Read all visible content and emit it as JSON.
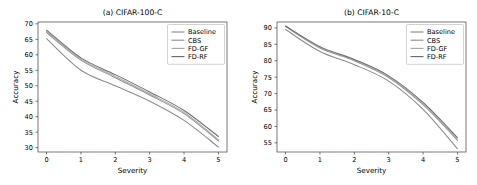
{
  "figure": {
    "background": "#ffffff",
    "panels": [
      "a",
      "b"
    ]
  },
  "chart_data": [
    {
      "type": "line",
      "title": "(a) CIFAR-100-C",
      "xlabel": "Severity",
      "ylabel": "Accuracy",
      "x": [
        0,
        1,
        2,
        3,
        4,
        5
      ],
      "xlim": [
        -0.25,
        5.25
      ],
      "ylim": [
        28.6,
        70.6
      ],
      "xticks": [
        0,
        1,
        2,
        3,
        4,
        5
      ],
      "xticklabels": [
        "0",
        "1",
        "2",
        "3",
        "4",
        "5"
      ],
      "yticks": [
        30,
        35,
        40,
        45,
        50,
        55,
        60,
        65,
        70
      ],
      "yticklabels": [
        "30",
        "35",
        "40",
        "45",
        "50",
        "55",
        "60",
        "65",
        "70"
      ],
      "grid": false,
      "legend_position": "upper right",
      "series": [
        {
          "name": "Baseline",
          "color": "#8c8c8c",
          "values": [
            65.2,
            55.0,
            50.0,
            45.0,
            38.8,
            30.2
          ]
        },
        {
          "name": "CBS",
          "color": "#909090",
          "values": [
            67.2,
            58.3,
            52.6,
            47.0,
            41.0,
            32.2
          ]
        },
        {
          "name": "FD-GF",
          "color": "#a8a8a8",
          "values": [
            67.6,
            58.6,
            53.0,
            47.4,
            41.4,
            32.6
          ]
        },
        {
          "name": "FD-RF",
          "color": "#6e6e6e",
          "values": [
            68.0,
            59.0,
            53.6,
            48.0,
            42.0,
            33.6
          ]
        }
      ]
    },
    {
      "type": "line",
      "title": "(b) CIFAR-10-C",
      "xlabel": "Severity",
      "ylabel": "Accuracy",
      "x": [
        0,
        1,
        2,
        3,
        4,
        5
      ],
      "xlim": [
        -0.25,
        5.25
      ],
      "ylim": [
        52.2,
        91.8
      ],
      "xticks": [
        0,
        1,
        2,
        3,
        4,
        5
      ],
      "xticklabels": [
        "0",
        "1",
        "2",
        "3",
        "4",
        "5"
      ],
      "yticks": [
        55,
        60,
        65,
        70,
        75,
        80,
        85,
        90
      ],
      "yticklabels": [
        "55",
        "60",
        "65",
        "70",
        "75",
        "80",
        "85",
        "90"
      ],
      "grid": false,
      "legend_position": "upper right",
      "series": [
        {
          "name": "Baseline",
          "color": "#8c8c8c",
          "values": [
            89.5,
            82.8,
            78.8,
            73.8,
            65.2,
            53.2
          ]
        },
        {
          "name": "CBS",
          "color": "#909090",
          "values": [
            90.4,
            83.9,
            80.0,
            74.9,
            66.6,
            55.8
          ]
        },
        {
          "name": "FD-GF",
          "color": "#a8a8a8",
          "values": [
            90.5,
            84.1,
            80.2,
            75.1,
            66.9,
            56.1
          ]
        },
        {
          "name": "FD-RF",
          "color": "#6e6e6e",
          "values": [
            90.6,
            84.3,
            80.4,
            75.4,
            67.3,
            56.6
          ]
        }
      ]
    }
  ]
}
